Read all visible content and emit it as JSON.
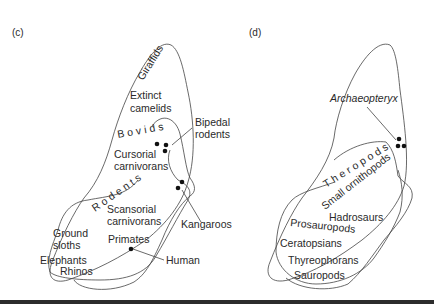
{
  "panels": [
    {
      "id": "c",
      "label": "(c)",
      "group_labels": {
        "giraffids": "Giraffids",
        "extinct_camelids_1": "Extinct",
        "extinct_camelids_2": "camelids",
        "bovids": "Bovids",
        "bipedal_rodents_1": "Bipedal",
        "bipedal_rodents_2": "rodents",
        "cursorial_1": "Cursorial",
        "cursorial_2": "carnivorans",
        "rodents": "Rodents",
        "scansorial_1": "Scansorial",
        "scansorial_2": "carnivorans",
        "kangaroos": "Kangaroos",
        "ground_sloths_1": "Ground",
        "ground_sloths_2": "sloths",
        "primates": "Primates",
        "human": "Human",
        "elephants": "Elephants",
        "rhinos": "Rhinos"
      }
    },
    {
      "id": "d",
      "label": "(d)",
      "group_labels": {
        "archaeopteryx": "Archaeopteryx",
        "theropods": "Theropods",
        "small_ornithopods": "Small ornithopods",
        "hadrosaurs": "Hadrosaurs",
        "prosauropods": "Prosauropods",
        "ceratopsians": "Ceratopsians",
        "thyreophorans": "Thyreophorans",
        "sauropods": "Sauropods"
      }
    }
  ],
  "colors": {
    "line": "#444444",
    "dot": "#111111",
    "text": "#2a2a2a",
    "bottom_rule": "#2c2c2c"
  }
}
